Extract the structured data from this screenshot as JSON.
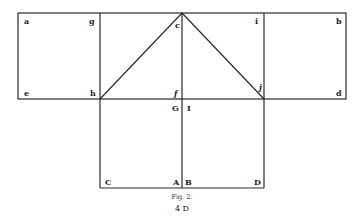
{
  "figure": {
    "caption": "Fig. 2.",
    "footer": "4 D",
    "points": {
      "a": "a",
      "g": "g",
      "c": "c",
      "i": "i",
      "b": "b",
      "e": "e",
      "h": "h",
      "f": "f",
      "j": "j",
      "d": "d",
      "G": "G",
      "I": "I",
      "C": "C",
      "A": "A",
      "B": "B",
      "D": "D"
    },
    "colors": {
      "ink": "#2a2a2a",
      "paper": "#ffffff"
    }
  }
}
